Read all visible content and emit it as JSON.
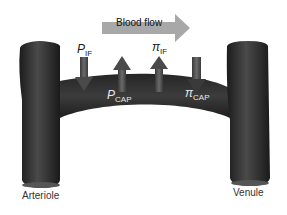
{
  "flow_arrow": {
    "label": "Blood flow",
    "color": "#a8a8a8",
    "direction": "right"
  },
  "vessels": {
    "left": {
      "label": "Arteriole"
    },
    "right": {
      "label": "Venule"
    },
    "capillary": {
      "color": "#2e2e2e"
    }
  },
  "forces": [
    {
      "symbol": "P",
      "subscript": "IF",
      "direction": "down",
      "position": "outside",
      "label_color": "#222222"
    },
    {
      "symbol": "P",
      "subscript": "CAP",
      "direction": "up",
      "position": "inside",
      "label_color": "#e8e8e8"
    },
    {
      "symbol": "π",
      "subscript": "IF",
      "direction": "up",
      "position": "outside",
      "label_color": "#222222"
    },
    {
      "symbol": "π",
      "subscript": "CAP",
      "direction": "down",
      "position": "inside",
      "label_color": "#e8e8e8"
    }
  ],
  "colors": {
    "vessel": "#2e2e2e",
    "arrow": "#5a5a5a",
    "flow_arrow": "#a8a8a8"
  }
}
